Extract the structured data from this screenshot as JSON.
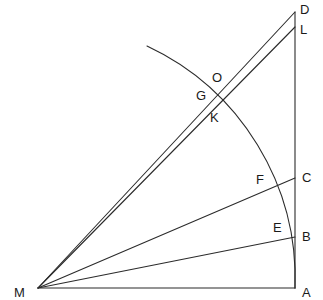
{
  "figure": {
    "width": 323,
    "height": 300,
    "background_color": "#ffffff",
    "stroke_color": "#2b2b2b",
    "label_color": "#1a1a1a",
    "stroke_width": 1.1
  },
  "points": [
    {
      "id": "M",
      "label": "M",
      "x": 38,
      "y": 288,
      "label_x": 14,
      "label_y": 286,
      "role": "apex-vertex"
    },
    {
      "id": "A",
      "label": "A",
      "x": 295,
      "y": 288,
      "label_x": 302,
      "label_y": 286,
      "role": "base-right-vertex"
    },
    {
      "id": "B",
      "label": "B",
      "x": 295,
      "y": 237,
      "label_x": 302,
      "label_y": 230,
      "role": "on-vertical-line"
    },
    {
      "id": "C",
      "label": "C",
      "x": 295,
      "y": 178,
      "label_x": 302,
      "label_y": 171,
      "role": "on-vertical-line"
    },
    {
      "id": "D",
      "label": "D",
      "x": 295,
      "y": 12,
      "label_x": 300,
      "label_y": 3,
      "role": "top-vertex"
    },
    {
      "id": "L",
      "label": "L",
      "x": 295,
      "y": 27,
      "label_x": 300,
      "label_y": 23,
      "role": "on-vertical-line"
    },
    {
      "id": "E",
      "label": "E",
      "x": 291,
      "y": 238,
      "label_x": 273,
      "label_y": 221,
      "role": "arc-meets-ray-MB"
    },
    {
      "id": "F",
      "label": "F",
      "x": 272,
      "y": 184,
      "label_x": 256,
      "label_y": 173,
      "role": "arc-meets-ray-MC"
    },
    {
      "id": "G",
      "label": "G",
      "x": 213,
      "y": 103,
      "label_x": 196,
      "label_y": 89,
      "role": "arc-meets-ray-ML"
    },
    {
      "id": "O",
      "label": "O",
      "x": 219,
      "y": 95,
      "label_x": 212,
      "label_y": 71,
      "role": "upper-crossing"
    },
    {
      "id": "K",
      "label": "K",
      "x": 221,
      "y": 110,
      "label_x": 210,
      "label_y": 111,
      "role": "lower-crossing"
    }
  ],
  "segments": [
    {
      "id": "MA",
      "name": "base-line-M-A",
      "x1": 38,
      "y1": 288,
      "x2": 295,
      "y2": 288
    },
    {
      "id": "DA",
      "name": "vertical-line-D-A",
      "x1": 295,
      "y1": 12,
      "x2": 295,
      "y2": 288
    },
    {
      "id": "MB",
      "name": "ray-M-B",
      "x1": 38,
      "y1": 288,
      "x2": 295,
      "y2": 237
    },
    {
      "id": "MC",
      "name": "ray-M-C",
      "x1": 38,
      "y1": 288,
      "x2": 295,
      "y2": 178
    },
    {
      "id": "MD",
      "name": "ray-M-D",
      "x1": 38,
      "y1": 288,
      "x2": 295,
      "y2": 12
    },
    {
      "id": "ML",
      "name": "ray-M-L",
      "x1": 38,
      "y1": 288,
      "x2": 295,
      "y2": 27
    }
  ],
  "arcs": [
    {
      "id": "arc-AE-F-GK",
      "name": "circular-arc-centered-at-M",
      "center_x": 38,
      "center_y": 288,
      "radius": 257,
      "start_x": 147,
      "start_y": 46,
      "end_x": 295,
      "end_y": 288,
      "sweep_flag": 1,
      "large_arc_flag": 0
    }
  ]
}
